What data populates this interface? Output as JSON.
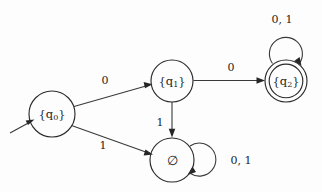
{
  "diagram": {
    "kind": "finite-automaton-state-diagram",
    "alphabet": [
      "0",
      "1"
    ],
    "background_color": "#fdfdfd",
    "stroke_color": "#2b2b2b",
    "text_color": "#1d1d1d",
    "states": [
      {
        "id": "q0",
        "label": "{q",
        "label_sub": "0",
        "label_close": "}",
        "x": 52,
        "y": 114,
        "radius": 23,
        "accepting": false,
        "start": true
      },
      {
        "id": "q1",
        "label": "{q",
        "label_sub": "1",
        "label_close": "}",
        "x": 172,
        "y": 81,
        "radius": 21,
        "accepting": false,
        "start": false
      },
      {
        "id": "q2",
        "label": "{q",
        "label_sub": "2",
        "label_close": "}",
        "x": 286,
        "y": 81,
        "radius": 21,
        "inner_radius": 17,
        "accepting": true,
        "start": false
      },
      {
        "id": "empty",
        "label": "∅",
        "label_sub": "",
        "label_close": "",
        "x": 172,
        "y": 160,
        "radius": 22,
        "accepting": false,
        "start": false
      }
    ],
    "transitions": [
      {
        "id": "t-q0-q1",
        "from": "q0",
        "to": "q1",
        "label": "0",
        "label_x": 105,
        "label_y": 80
      },
      {
        "id": "t-q0-empty",
        "from": "q0",
        "to": "empty",
        "label": "1",
        "label_x": 103,
        "label_y": 145
      },
      {
        "id": "t-q1-q2",
        "from": "q1",
        "to": "q2",
        "label": "0",
        "label_x": 231,
        "label_y": 67
      },
      {
        "id": "t-q1-empty",
        "from": "q1",
        "to": "empty",
        "label": "1",
        "label_x": 160,
        "label_y": 122
      },
      {
        "id": "t-q2-q2",
        "from": "q2",
        "to": "q2",
        "label": "0, 1",
        "label_x": 282,
        "label_y": 19,
        "self_loop": true
      },
      {
        "id": "t-empty-empty",
        "from": "empty",
        "to": "empty",
        "label": "0, 1",
        "label_x": 241,
        "label_y": 160,
        "self_loop": true
      }
    ],
    "start_arrow": {
      "name": "start-arrow",
      "from_x": 10,
      "from_y": 132,
      "to_x": 33,
      "to_y": 120
    }
  }
}
